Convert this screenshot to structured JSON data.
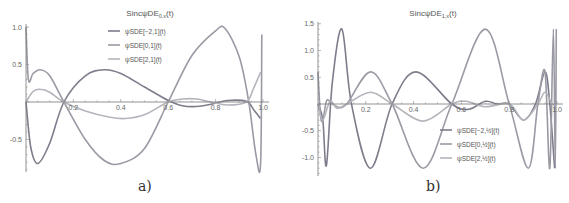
{
  "chart_data": [
    {
      "type": "line",
      "panel_label": "a)",
      "title": "SincψDE",
      "title_sub": "0,x",
      "title_suffix": "(t)",
      "xlabel": "",
      "ylabel": "",
      "xlim": [
        0,
        1.0
      ],
      "ylim": [
        -0.9,
        1.05
      ],
      "xticks": [
        "0.2",
        "0.4",
        "0.6",
        "0.8",
        "1.0"
      ],
      "yticks": [
        "1.0",
        "0.5",
        "-0.5"
      ],
      "grid": false,
      "legend_position": "top-center",
      "series": [
        {
          "name": "ψSDE[−2,1](t)",
          "color": "#7d7d8c",
          "x": [
            0,
            0.02,
            0.05,
            0.1,
            0.16,
            0.25,
            0.33,
            0.4,
            0.5,
            0.6,
            0.66,
            0.72,
            0.78,
            0.85,
            0.93,
            0.96,
            0.99
          ],
          "y": [
            0,
            -0.6,
            -0.82,
            -0.55,
            0,
            0.35,
            0.43,
            0.38,
            0.2,
            0.02,
            -0.05,
            -0.06,
            -0.03,
            0.02,
            0.01,
            -0.1,
            -0.22
          ]
        },
        {
          "name": "ψSDE[0,1](t)",
          "color": "#9a9aa5",
          "x": [
            0,
            0.01,
            0.03,
            0.06,
            0.1,
            0.16,
            0.25,
            0.33,
            0.4,
            0.5,
            0.6,
            0.7,
            0.8,
            0.84,
            0.9,
            0.94,
            0.97,
            0.99,
            0.995
          ],
          "y": [
            1.0,
            0.3,
            0.38,
            0.43,
            0.35,
            0,
            -0.5,
            -0.78,
            -0.82,
            -0.62,
            0,
            0.62,
            0.95,
            0.98,
            0.6,
            0,
            -0.7,
            -0.82,
            0.9
          ]
        },
        {
          "name": "ψSDE[2,1](t)",
          "color": "#b4b4bc",
          "x": [
            0,
            0.03,
            0.06,
            0.1,
            0.16,
            0.25,
            0.35,
            0.42,
            0.5,
            0.6,
            0.66,
            0.72,
            0.78,
            0.85,
            0.93,
            0.96,
            0.99
          ],
          "y": [
            0,
            0.14,
            0.17,
            0.13,
            0,
            -0.12,
            -0.2,
            -0.22,
            -0.17,
            0.0,
            0.04,
            0.04,
            0.0,
            -0.04,
            0.0,
            0.18,
            0.4
          ]
        }
      ]
    },
    {
      "type": "line",
      "panel_label": "b)",
      "title": "SincψDE",
      "title_sub": "1,x",
      "title_suffix": "(t)",
      "xlabel": "",
      "ylabel": "",
      "xlim": [
        0,
        1.0
      ],
      "ylim": [
        -1.3,
        1.55
      ],
      "xticks": [
        "0.2",
        "0.4",
        "0.6",
        "0.8",
        "1.0"
      ],
      "yticks": [
        "1.5",
        "1.0",
        "0.5",
        "-0.5",
        "-1.0"
      ],
      "grid": false,
      "legend_position": "bottom-right",
      "series": [
        {
          "name": "ψSDE[−2,½](t)",
          "color": "#7d7d8c",
          "x": [
            0,
            0.02,
            0.035,
            0.06,
            0.1,
            0.14,
            0.22,
            0.31,
            0.41,
            0.56,
            0.63,
            0.7,
            0.75,
            0.8,
            0.86,
            0.91,
            0.95,
            0.97,
            0.99
          ],
          "y": [
            0,
            -0.3,
            -1.15,
            0.4,
            1.4,
            0,
            -1.2,
            0,
            0.6,
            0,
            -0.1,
            0.05,
            0.0,
            0,
            -0.3,
            0.0,
            0.6,
            0,
            -1.2
          ]
        },
        {
          "name": "ψSDE[0,½](t)",
          "color": "#9a9aa5",
          "x": [
            0,
            0.01,
            0.02,
            0.035,
            0.05,
            0.08,
            0.12,
            0.22,
            0.31,
            0.44,
            0.56,
            0.7,
            0.8,
            0.88,
            0.92,
            0.95,
            0.97,
            0.985,
            0.993,
            0.997
          ],
          "y": [
            0.6,
            -0.2,
            -0.3,
            0.05,
            0.05,
            -0.05,
            0,
            0.6,
            0,
            -1.2,
            0,
            1.4,
            0,
            -1.2,
            0,
            0.6,
            -1.2,
            1.4,
            -1.2,
            1.4
          ]
        },
        {
          "name": "ψSDE[2,½](t)",
          "color": "#b4b4bc",
          "x": [
            0,
            0.02,
            0.05,
            0.08,
            0.12,
            0.22,
            0.31,
            0.44,
            0.56,
            0.62,
            0.7,
            0.8,
            0.86,
            0.92,
            0.95,
            0.98,
            1.0
          ],
          "y": [
            0,
            -0.3,
            0.05,
            -0.08,
            0,
            0.22,
            0,
            -0.32,
            0,
            0.05,
            -0.05,
            0,
            -0.3,
            0,
            0.22,
            0,
            0
          ]
        }
      ]
    }
  ]
}
